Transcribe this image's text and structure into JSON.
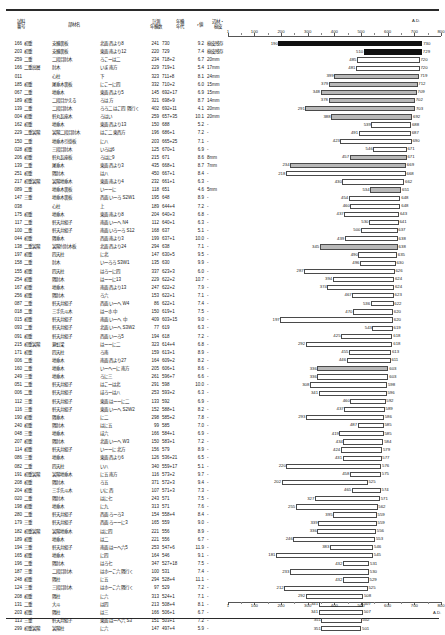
{
  "axis": {
    "ad_label": "A.D.",
    "ticks": [
      1,
      100,
      200,
      300,
      400,
      500,
      600,
      700,
      800
    ],
    "min": 1,
    "max": 800
  },
  "header": {
    "sample_l1": "試料",
    "sample_l2": "番号",
    "member": "部材名",
    "count_l1": "計測",
    "count_l2": "年輪数",
    "year_l1": "年輪",
    "year_l2": "年代",
    "r": "r値",
    "sap_l1": "辺材・",
    "sap_l2": "樹皮"
  },
  "chart_data": {
    "type": "bar",
    "orientation": "horizontal-range",
    "title": "",
    "xlabel": "A.D.",
    "ylabel": "",
    "xlim": [
      1,
      800
    ],
    "grid": false,
    "legend": null,
    "note": "Each bar spans from the first measured ring year (left label) to the last ring year (right label) for one timber sample."
  },
  "rows": [
    {
      "no": "166",
      "floor": "初重",
      "member": "支輪裏板",
      "pos": "北面 西より8",
      "count": "241",
      "year": "730",
      "r": "9.2",
      "sap": "樹皮残存",
      "start": 190,
      "end": 730,
      "style": "black"
    },
    {
      "no": "203",
      "floor": "初重",
      "member": "支輪裏板",
      "pos": "東面 南より12",
      "count": "220",
      "year": "729",
      "r": "7.4",
      "sap": "樹皮残存",
      "start": 510,
      "end": 729,
      "style": "black"
    },
    {
      "no": "259",
      "floor": "二重",
      "member": "二段目肘木",
      "pos": "ろこーは二",
      "count": "234",
      "year": "718+2",
      "r": "6.7",
      "sap": "20mm",
      "start": 485,
      "end": 720,
      "style": "white"
    },
    {
      "no": "166",
      "floor": "二重高層",
      "member": "肘木",
      "pos": "いま 南方",
      "count": "229",
      "year": "719+1",
      "r": "5.4",
      "sap": "17mm",
      "start": 481,
      "end": 720,
      "style": "white"
    },
    {
      "no": "011",
      "floor": "",
      "member": "心柱",
      "pos": "下",
      "count": "323",
      "year": "711+8",
      "r": "8.1",
      "sap": "24mm",
      "start": 399,
      "end": 719,
      "style": "gray"
    },
    {
      "no": "185",
      "floor": "初重",
      "member": "尾垂木裏板",
      "pos": "にこーに四",
      "count": "332",
      "year": "710+2",
      "r": "6.0",
      "sap": "15mm",
      "start": 379,
      "end": 712,
      "style": "gray"
    },
    {
      "no": "067",
      "floor": "二重",
      "member": "地垂木",
      "pos": "東面 西より5",
      "count": "145",
      "year": "692+17",
      "r": "6.9",
      "sap": "15mm",
      "start": 348,
      "end": 709,
      "style": "gray"
    },
    {
      "no": "189",
      "floor": "初重",
      "member": "二段目かえる",
      "pos": "ろは 方",
      "count": "321",
      "year": "698+9",
      "r": "8.7",
      "sap": "14mm",
      "start": 378,
      "end": 702,
      "style": "gray"
    },
    {
      "no": "139",
      "floor": "二重",
      "member": "二段目肘木",
      "pos": "ろろ二 はこ四 隅行く",
      "count": "402",
      "year": "692+11",
      "r": "4.1",
      "sap": "20mm",
      "start": 291,
      "end": 703,
      "style": "gray"
    },
    {
      "no": "004",
      "floor": "初重",
      "member": "軒丸瓦座木",
      "pos": "ろはい",
      "count": "259",
      "year": "657+35",
      "r": "10.1",
      "sap": "20mm",
      "start": 388,
      "end": 692,
      "style": "gray"
    },
    {
      "no": "162",
      "floor": "初重",
      "member": "地垂木",
      "pos": "東面 西より13",
      "count": "150",
      "year": "688",
      "r": "5.2",
      "sap": "-",
      "start": 539,
      "end": 688,
      "style": "white"
    },
    {
      "no": "229",
      "floor": "二重裳階",
      "member": "裳階二段目肘木",
      "pos": "はこ二 東西方",
      "count": "196",
      "year": "686+1",
      "r": "7.2",
      "sap": "-",
      "start": 491,
      "end": 687,
      "style": "white"
    },
    {
      "no": "150",
      "floor": "二重",
      "member": "地垂木引掛板",
      "pos": "に八",
      "count": "203",
      "year": "665+25",
      "r": "7.1",
      "sap": "-",
      "start": 423,
      "end": 690,
      "style": "white"
    },
    {
      "no": "028",
      "floor": "初重",
      "member": "三段目肘木",
      "pos": "いろは6",
      "count": "125",
      "year": "670+1",
      "r": "6.9",
      "sap": "-",
      "start": 546,
      "end": 671,
      "style": "white"
    },
    {
      "no": "206",
      "floor": "初重",
      "member": "軒丸瓦座板",
      "pos": "ろはに9",
      "count": "215",
      "year": "671",
      "r": "8.6",
      "sap": "8mm",
      "start": 457,
      "end": 671,
      "style": "gray"
    },
    {
      "no": "139",
      "floor": "二重",
      "member": "尾垂木",
      "pos": "東面 西より3",
      "count": "435",
      "year": "668+1",
      "r": "8.7",
      "sap": "7mm",
      "start": 234,
      "end": 669,
      "style": "gray"
    },
    {
      "no": "251",
      "floor": "初重",
      "member": "隅肘木",
      "pos": "は八",
      "count": "450",
      "year": "667+1",
      "r": "8.4",
      "sap": "-",
      "start": 218,
      "end": 668,
      "style": "white"
    },
    {
      "no": "217",
      "floor": "初重裳階",
      "member": "裳階地垂木",
      "pos": "東面 南より4",
      "count": "232",
      "year": "661+1",
      "r": "6.3",
      "sap": "-",
      "start": 430,
      "end": 662,
      "style": "white"
    },
    {
      "no": "089",
      "floor": "二重",
      "member": "地垂木裏板",
      "pos": "いーーに",
      "count": "118",
      "year": "651",
      "r": "4.6",
      "sap": "5mm",
      "start": 534,
      "end": 651,
      "style": "gray"
    },
    {
      "no": "147",
      "floor": "三重",
      "member": "地垂木裏板",
      "pos": "西面 いーろ S2W1",
      "count": "195",
      "year": "648",
      "r": "8.9",
      "sap": "-",
      "start": 454,
      "end": 648,
      "style": "white"
    },
    {
      "no": "038",
      "floor": "",
      "member": "心柱",
      "pos": "上",
      "count": "189",
      "year": "644+4",
      "r": "7.2",
      "sap": "-",
      "start": 460,
      "end": 648,
      "style": "white"
    },
    {
      "no": "175",
      "floor": "初重",
      "member": "地垂木",
      "pos": "東面 南より8",
      "count": "204",
      "year": "640+3",
      "r": "6.8",
      "sap": "-",
      "start": 437,
      "end": 643,
      "style": "white"
    },
    {
      "no": "117",
      "floor": "二重",
      "member": "軒天井組子",
      "pos": "南面 いーへ N4",
      "count": "112",
      "year": "640+1",
      "r": "6.3",
      "sap": "-",
      "start": 530,
      "end": 641,
      "style": "white"
    },
    {
      "no": "100",
      "floor": "二重",
      "member": "軒天井組子",
      "pos": "南面 いろーろ S12",
      "count": "168",
      "year": "637",
      "r": "5.1",
      "sap": "-",
      "start": 500,
      "end": 637,
      "style": "white"
    },
    {
      "no": "044",
      "floor": "初重",
      "member": "隅垂木",
      "pos": "西面 南より3",
      "count": "199",
      "year": "637+1",
      "r": "10.0",
      "sap": "-",
      "start": 439,
      "end": 638,
      "style": "white"
    },
    {
      "no": "138",
      "floor": "二重裳階",
      "member": "裳階付肘木板",
      "pos": "北面 西より24",
      "count": "294",
      "year": "638",
      "r": "7.1",
      "sap": "-",
      "start": 345,
      "end": 638,
      "style": "gray"
    },
    {
      "no": "197",
      "floor": "初重",
      "member": "四天柱",
      "pos": "に北",
      "count": "147",
      "year": "630+5",
      "r": "9.5",
      "sap": "-",
      "start": 490,
      "end": 635,
      "style": "white"
    },
    {
      "no": "158",
      "floor": "二重",
      "member": "肘木",
      "pos": "いーろろ S3W1",
      "count": "135",
      "year": "630",
      "r": "9.9",
      "sap": "-",
      "start": 496,
      "end": 630,
      "style": "white"
    },
    {
      "no": "155",
      "floor": "初重",
      "member": "四天柱",
      "pos": "はろーに四",
      "count": "337",
      "year": "623+3",
      "r": "6.0",
      "sap": "-",
      "start": 287,
      "end": 626,
      "style": "white"
    },
    {
      "no": "254",
      "floor": "初重",
      "member": "隅肘木",
      "pos": "はーーに13",
      "count": "229",
      "year": "622+2",
      "r": "10.7",
      "sap": "-",
      "start": 394,
      "end": 624,
      "style": "white"
    },
    {
      "no": "167",
      "floor": "初重",
      "member": "地垂木",
      "pos": "南面 西より13",
      "count": "247",
      "year": "622+2",
      "r": "7.9",
      "sap": "-",
      "start": 374,
      "end": 624,
      "style": "white"
    },
    {
      "no": "256",
      "floor": "初重",
      "member": "隅肘木",
      "pos": "ろ六",
      "count": "153",
      "year": "622+1",
      "r": "7.1",
      "sap": "-",
      "start": 467,
      "end": 623,
      "style": "white"
    },
    {
      "no": "087",
      "floor": "二重",
      "member": "軒天井組子",
      "pos": "西面 いーへ W4",
      "count": "86",
      "year": "622+1",
      "r": "7.4",
      "sap": "-",
      "start": 536,
      "end": 622,
      "style": "white"
    },
    {
      "no": "018",
      "floor": "二重",
      "member": "三手先斗木",
      "pos": "はーホ 中",
      "count": "150",
      "year": "619+1",
      "r": "7.5",
      "sap": "-",
      "start": 470,
      "end": 620,
      "style": "white"
    },
    {
      "no": "015",
      "floor": "初重",
      "member": "軒天井組子",
      "pos": "南面 いーへ 中",
      "count": "409",
      "year": "603+15",
      "r": "9.0",
      "sap": "-",
      "start": 197,
      "end": 620,
      "style": "white"
    },
    {
      "no": "093",
      "floor": "二重",
      "member": "軒天井組子",
      "pos": "北面 いーへ S3W2",
      "count": "77",
      "year": "619",
      "r": "6.3",
      "sap": "-",
      "start": 543,
      "end": 619,
      "style": "white"
    },
    {
      "no": "091",
      "floor": "初重",
      "member": "軒天井組子",
      "pos": "西面 いーろ5",
      "count": "194",
      "year": "618",
      "r": "7.2",
      "sap": "-",
      "start": 425,
      "end": 618,
      "style": "white"
    },
    {
      "no": "215",
      "floor": "初重裳階",
      "member": "繋虹梁",
      "pos": "はーーに二",
      "count": "323",
      "year": "614+4",
      "r": "6.8",
      "sap": "-",
      "start": 292,
      "end": 618,
      "style": "white"
    },
    {
      "no": "171",
      "floor": "初重",
      "member": "四天柱",
      "pos": "ろ南",
      "count": "159",
      "year": "613+1",
      "r": "8.9",
      "sap": "-",
      "start": 455,
      "end": 613,
      "style": "white"
    },
    {
      "no": "006",
      "floor": "二重",
      "member": "地垂木",
      "pos": "南面 西より27",
      "count": "164",
      "year": "609+2",
      "r": "8.2",
      "sap": "-",
      "start": 446,
      "end": 611,
      "style": "white"
    },
    {
      "no": "160",
      "floor": "二重",
      "member": "地垂木",
      "pos": "いーへーに 南方",
      "count": "205",
      "year": "606+1",
      "r": "8.6",
      "sap": "-",
      "start": 336,
      "end": 603,
      "style": "gray"
    },
    {
      "no": "249",
      "floor": "三重",
      "member": "地垂木",
      "pos": "ろに三",
      "count": "261",
      "year": "596+7",
      "r": "6.6",
      "sap": "-",
      "start": 336,
      "end": 603,
      "style": "white"
    },
    {
      "no": "051",
      "floor": "二重",
      "member": "軒天井組子",
      "pos": "はこーは北",
      "count": "291",
      "year": "598",
      "r": "10.0",
      "sap": "-",
      "start": 308,
      "end": 598,
      "style": "white"
    },
    {
      "no": "006",
      "floor": "二重",
      "member": "軒天井組子",
      "pos": "ほろーは八",
      "count": "253",
      "year": "593+2",
      "r": "6.3",
      "sap": "-",
      "start": 341,
      "end": 596,
      "style": "white"
    },
    {
      "no": "112",
      "floor": "三重",
      "member": "軒天井組子",
      "pos": "東面 はーーに二",
      "count": "133",
      "year": "592",
      "r": "6.9",
      "sap": "-",
      "start": 460,
      "end": 592,
      "style": "white"
    },
    {
      "no": "116",
      "floor": "三重",
      "member": "軒天井組子",
      "pos": "東面 いーへ S2W2",
      "count": "152",
      "year": "588+1",
      "r": "8.2",
      "sap": "-",
      "start": 437,
      "end": 589,
      "style": "white"
    },
    {
      "no": "190",
      "floor": "初重",
      "member": "隅垂木",
      "pos": "に二",
      "count": "298",
      "year": "585+2",
      "r": "7.8",
      "sap": "-",
      "start": 293,
      "end": 586,
      "style": "white"
    },
    {
      "no": "240",
      "floor": "初重",
      "member": "隅肘木",
      "pos": "はに五",
      "count": "99",
      "year": "585",
      "r": "7.0",
      "sap": "-",
      "start": 487,
      "end": 585,
      "style": "white"
    },
    {
      "no": "048",
      "floor": "三重",
      "member": "地垂木",
      "pos": "ほ六",
      "count": "166",
      "year": "584+1",
      "r": "6.9",
      "sap": "-",
      "start": 419,
      "end": 585,
      "style": "white"
    },
    {
      "no": "207",
      "floor": "初重",
      "member": "隅肘木",
      "pos": "北面 いーへ W3",
      "count": "150",
      "year": "583+1",
      "r": "7.2",
      "sap": "-",
      "start": 434,
      "end": 584,
      "style": "white"
    },
    {
      "no": "114",
      "floor": "初重",
      "member": "軒天井組子",
      "pos": "いーーに 北方",
      "count": "156",
      "year": "579",
      "r": "8.9",
      "sap": "-",
      "start": 424,
      "end": 579,
      "style": "white"
    },
    {
      "no": "086",
      "floor": "三重",
      "member": "地垂木",
      "pos": "東面 西より6",
      "count": "126",
      "year": "536+21",
      "r": "6.5",
      "sap": "-",
      "start": 431,
      "end": 577,
      "style": "white"
    },
    {
      "no": "082",
      "floor": "二重",
      "member": "四天柱",
      "pos": "い八",
      "count": "340",
      "year": "559+17",
      "r": "5.1",
      "sap": "-",
      "start": 220,
      "end": 576,
      "style": "white"
    },
    {
      "no": "191",
      "floor": "初重裳階",
      "member": "裳階地垂木",
      "pos": "に五 南方",
      "count": "116",
      "year": "573+2",
      "r": "9.7",
      "sap": "-",
      "start": 458,
      "end": 575,
      "style": "white"
    },
    {
      "no": "208",
      "floor": "初重",
      "member": "隅肘木",
      "pos": "ろ五",
      "count": "371",
      "year": "572+3",
      "r": "9.4",
      "sap": "-",
      "start": 202,
      "end": 525,
      "style": "white"
    },
    {
      "no": "204",
      "floor": "初重",
      "member": "三手先斗木",
      "pos": "いに 西",
      "count": "107",
      "year": "571+3",
      "r": "7.3",
      "sap": "-",
      "start": 465,
      "end": 574,
      "style": "white"
    },
    {
      "no": "020",
      "floor": "二重",
      "member": "隅肘木",
      "pos": "はに七",
      "count": "243",
      "year": "571",
      "r": "7.5",
      "sap": "-",
      "start": 327,
      "end": 571,
      "style": "white"
    },
    {
      "no": "198",
      "floor": "初重",
      "member": "地垂木",
      "pos": "に九",
      "count": "313",
      "year": "571",
      "r": "7.6",
      "sap": "-",
      "start": 255,
      "end": 562,
      "style": "white"
    },
    {
      "no": "280",
      "floor": "二重",
      "member": "軒天井組子",
      "pos": "西面 ろーろ3",
      "count": "154",
      "year": "558+4",
      "r": "8.4",
      "sap": "-",
      "start": 395,
      "end": 559,
      "style": "white"
    },
    {
      "no": "179",
      "floor": "三重",
      "member": "軒天井組子",
      "pos": "西面 ろーーに3",
      "count": "165",
      "year": "559",
      "r": "9.0",
      "sap": "-",
      "start": 339,
      "end": 559,
      "style": "white"
    },
    {
      "no": "182",
      "floor": "初重裳階",
      "member": "裳階地垂木",
      "pos": "はに四",
      "count": "221",
      "year": "556",
      "r": "8.9",
      "sap": "-",
      "start": 336,
      "end": 556,
      "style": "white"
    },
    {
      "no": "189",
      "floor": "初重",
      "member": "地垂木",
      "pos": "は二",
      "count": "221",
      "year": "556",
      "r": "6.7",
      "sap": "-",
      "start": 246,
      "end": 553,
      "style": "white"
    },
    {
      "no": "194",
      "floor": "三重",
      "member": "軒天井組子",
      "pos": "南面 はーへ六5",
      "count": "253",
      "year": "547+6",
      "r": "11.9",
      "sap": "-",
      "start": 383,
      "end": 546,
      "style": "white"
    },
    {
      "no": "165",
      "floor": "初重",
      "member": "地垂木",
      "pos": "に四",
      "count": "164",
      "year": "546",
      "r": "9.1",
      "sap": "-",
      "start": 181,
      "end": 545,
      "style": "white"
    },
    {
      "no": "196",
      "floor": "二重",
      "member": "隅肘木",
      "pos": "はろ七",
      "count": "347",
      "year": "527+18",
      "r": "7.5",
      "sap": "-",
      "start": 432,
      "end": 531,
      "style": "white"
    },
    {
      "no": "187",
      "floor": "三重",
      "member": "二段目肘木",
      "pos": "はホーこ六 隅行く",
      "count": "100",
      "year": "531",
      "r": "7.4",
      "sap": "-",
      "start": 233,
      "end": 530,
      "style": "white"
    },
    {
      "no": "248",
      "floor": "初重",
      "member": "隅柱",
      "pos": "に五",
      "count": "294",
      "year": "528+4",
      "r": "11.1",
      "sap": "-",
      "start": 432,
      "end": 529,
      "style": "white"
    },
    {
      "no": "124",
      "floor": "三重",
      "member": "三段目肘木",
      "pos": "はホーこ六 隅行く",
      "count": "97",
      "year": "529",
      "r": "7.2",
      "sap": "-",
      "start": 212,
      "end": 525,
      "style": "white"
    },
    {
      "no": "208",
      "floor": "初重",
      "member": "隅柱",
      "pos": "に六",
      "count": "313",
      "year": "524+1",
      "r": "7.1",
      "sap": "-",
      "start": 292,
      "end": 508,
      "style": "white"
    },
    {
      "no": "131",
      "floor": "二重",
      "member": "大斗",
      "pos": "は四",
      "count": "213",
      "year": "508+4",
      "r": "8.1",
      "sap": "-",
      "start": 341,
      "end": 507,
      "style": "white"
    },
    {
      "no": "203",
      "floor": "初重",
      "member": "隅柱",
      "pos": "は三",
      "count": "166",
      "year": "506+1",
      "r": "6.7",
      "sap": "-",
      "start": 341,
      "end": 507,
      "style": "white"
    },
    {
      "no": "113",
      "floor": "三重",
      "member": "軒天井組子",
      "pos": "東面 はーへ六 S3",
      "count": "151",
      "year": "503+1",
      "r": "7.2",
      "sap": "-",
      "start": 351,
      "end": 502,
      "style": "white"
    },
    {
      "no": "299",
      "floor": "初重裳階",
      "member": "裳階柱",
      "pos": "に六",
      "count": "147",
      "year": "497+4",
      "r": "5.9",
      "sap": "-",
      "start": 351,
      "end": 501,
      "style": "white"
    }
  ]
}
